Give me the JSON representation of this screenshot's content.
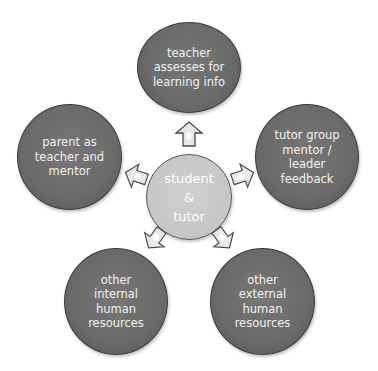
{
  "diagram": {
    "type": "radial-cycle",
    "center": {
      "id": "student-tutor",
      "lines": [
        "student",
        "&",
        "tutor"
      ],
      "color": "#c8c8c8"
    },
    "nodes": [
      {
        "id": "teacher",
        "position": "top",
        "lines": [
          "teacher",
          "assesses for",
          "learning info"
        ]
      },
      {
        "id": "tutor-group",
        "position": "right",
        "lines": [
          "tutor group",
          "mentor /",
          "leader",
          "feedback"
        ]
      },
      {
        "id": "external",
        "position": "bottom-right",
        "lines": [
          "other",
          "external",
          "human",
          "resources"
        ]
      },
      {
        "id": "internal",
        "position": "bottom-left",
        "lines": [
          "other",
          "internal",
          "human",
          "resources"
        ]
      },
      {
        "id": "parent",
        "position": "left",
        "lines": [
          "parent as",
          "teacher and",
          "mentor"
        ]
      }
    ],
    "node_color": "#6b6b6b",
    "arrow_fill": "#e8e8e8",
    "arrow_stroke": "#4a4a4a",
    "edges": [
      {
        "from": "student-tutor",
        "to": "teacher"
      },
      {
        "from": "student-tutor",
        "to": "tutor-group"
      },
      {
        "from": "student-tutor",
        "to": "external"
      },
      {
        "from": "student-tutor",
        "to": "internal"
      },
      {
        "from": "student-tutor",
        "to": "parent"
      }
    ]
  }
}
